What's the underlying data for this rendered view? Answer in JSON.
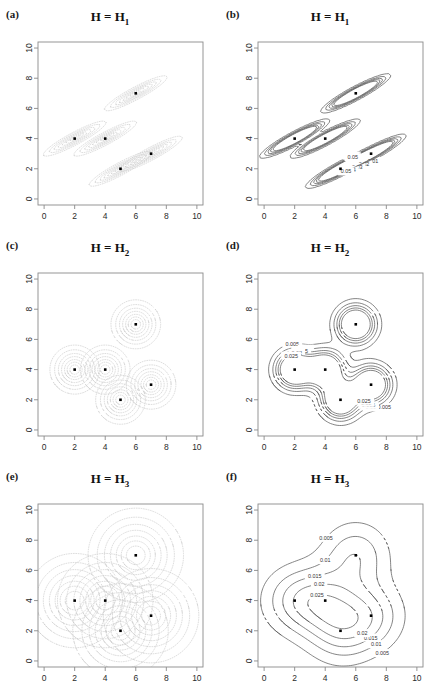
{
  "figure": {
    "width": 440,
    "height": 693,
    "background": "#ffffff",
    "panel_rows": 3,
    "panel_cols": 2
  },
  "style": {
    "box_color": "#8a8a8a",
    "axis_text_color": "#2b2b2b",
    "point_color": "#000000",
    "kernel_contour_color": "#c9c9c9",
    "density_contour_color": "#555555",
    "contour_label_color": "#333333"
  },
  "data_points": {
    "label": "sample points",
    "marker": "filled-square",
    "x": [
      2,
      4,
      5,
      6,
      7
    ],
    "y": [
      4,
      4,
      2,
      7,
      3
    ],
    "points": [
      {
        "x": 2,
        "y": 4
      },
      {
        "x": 4,
        "y": 4
      },
      {
        "x": 5,
        "y": 2
      },
      {
        "x": 6,
        "y": 7
      },
      {
        "x": 7,
        "y": 3
      }
    ]
  },
  "axes": {
    "xlim": [
      -0.4,
      10.4
    ],
    "ylim": [
      -0.4,
      10.4
    ],
    "xticks": [
      0,
      2,
      4,
      6,
      8,
      10
    ],
    "yticks": [
      0,
      2,
      4,
      6,
      8,
      10
    ],
    "xticklabels": [
      "0",
      "2",
      "4",
      "6",
      "8",
      "10"
    ],
    "yticklabels": [
      "0",
      "2",
      "4",
      "6",
      "8",
      "10"
    ],
    "ylabel_rotated": true,
    "grid": false
  },
  "bandwidths": {
    "H1": {
      "name": "H1",
      "sxx": 1.0,
      "syy": 0.32,
      "sxy": 0.52
    },
    "H2": {
      "name": "H2",
      "sxx": 0.62,
      "syy": 0.62,
      "sxy": 0.0
    },
    "H3": {
      "name": "H3",
      "sxx": 2.3,
      "syy": 2.3,
      "sxy": 0.0
    }
  },
  "panels": [
    {
      "tag": "(a)",
      "title_lhs": "H",
      "title_eq": " = ",
      "title_rhs": "H",
      "title_sub": "1",
      "kind": "kernels",
      "bandwidth": "H1",
      "kernel_levels": [
        0.12,
        0.25,
        0.4,
        0.55,
        0.7,
        0.82,
        0.92
      ],
      "contour_labels": []
    },
    {
      "tag": "(b)",
      "title_lhs": "H",
      "title_eq": " = ",
      "title_rhs": "H",
      "title_sub": "1",
      "kind": "density",
      "bandwidth": "H1",
      "contour_levels": [
        0.01,
        0.02,
        0.03,
        0.04,
        0.05
      ],
      "contour_labels": [
        "0.01",
        "0.02",
        "0.03",
        "0.04",
        "0.05"
      ]
    },
    {
      "tag": "(c)",
      "title_lhs": "H",
      "title_eq": " = ",
      "title_rhs": "H",
      "title_sub": "2",
      "kind": "kernels",
      "bandwidth": "H2",
      "kernel_levels": [
        0.12,
        0.25,
        0.4,
        0.55,
        0.7,
        0.82,
        0.92
      ],
      "contour_labels": []
    },
    {
      "tag": "(d)",
      "title_lhs": "H",
      "title_eq": " = ",
      "title_rhs": "H",
      "title_sub": "2",
      "kind": "density",
      "bandwidth": "H2",
      "contour_levels": [
        0.005,
        0.01,
        0.015,
        0.02,
        0.025
      ],
      "contour_labels": [
        "0.005",
        "0.01",
        "0.015",
        "0.02",
        "0.025"
      ]
    },
    {
      "tag": "(e)",
      "title_lhs": "H",
      "title_eq": " = ",
      "title_rhs": "H",
      "title_sub": "3",
      "kind": "kernels",
      "bandwidth": "H3",
      "kernel_levels": [
        0.12,
        0.25,
        0.4,
        0.55,
        0.7,
        0.82,
        0.92
      ],
      "contour_labels": []
    },
    {
      "tag": "(f)",
      "title_lhs": "H",
      "title_eq": " = ",
      "title_rhs": "H",
      "title_sub": "3",
      "kind": "density",
      "bandwidth": "H3",
      "contour_levels": [
        0.005,
        0.01,
        0.015,
        0.02,
        0.025
      ],
      "contour_labels": [
        "0.005",
        "0.01",
        "0.015",
        "0.02",
        "0.025"
      ]
    }
  ],
  "chart_data": {
    "type": "contour",
    "xlabel": "",
    "ylabel": "",
    "xlim": [
      -0.4,
      10.4
    ],
    "ylim": [
      -0.4,
      10.4
    ],
    "grid": false,
    "legend": "none",
    "sample": {
      "n": 5,
      "x": [
        2,
        4,
        5,
        6,
        7
      ],
      "y": [
        4,
        4,
        2,
        6,
        3
      ]
    },
    "panels": [
      {
        "tag": "(a)",
        "title": "H = H1",
        "content": "individual kernel contours, anisotropic positively-correlated ellipses",
        "levels": [
          0.12,
          0.25,
          0.4,
          0.55,
          0.7,
          0.82,
          0.92
        ],
        "labeled_levels": []
      },
      {
        "tag": "(b)",
        "title": "H = H1",
        "content": "pooled density estimate, three separated modes",
        "levels": [
          0.01,
          0.02,
          0.03,
          0.04,
          0.05
        ],
        "labeled_levels": [
          "0.01",
          "0.02",
          "0.03",
          "0.04",
          "0.05"
        ]
      },
      {
        "tag": "(c)",
        "title": "H = H2",
        "content": "individual kernel contours, isotropic circles",
        "levels": [
          0.12,
          0.25,
          0.4,
          0.55,
          0.7,
          0.82,
          0.92
        ],
        "labeled_levels": []
      },
      {
        "tag": "(d)",
        "title": "H = H2",
        "content": "pooled density estimate, one sharp mode at (6,7) plus merged lower cluster",
        "levels": [
          0.005,
          0.01,
          0.015,
          0.02,
          0.025
        ],
        "labeled_levels": [
          "0.005",
          "0.01",
          "0.015",
          "0.02",
          "0.025"
        ]
      },
      {
        "tag": "(e)",
        "title": "H = H3",
        "content": "individual kernel contours, large overlapping isotropic circles",
        "levels": [
          0.12,
          0.25,
          0.4,
          0.55,
          0.7,
          0.82,
          0.92
        ],
        "labeled_levels": []
      },
      {
        "tag": "(f)",
        "title": "H = H3",
        "content": "pooled density estimate, single oversmoothed unimodal blob",
        "levels": [
          0.005,
          0.01,
          0.015,
          0.02,
          0.025
        ],
        "labeled_levels": [
          "0.005",
          "0.01",
          "0.015",
          "0.02",
          "0.025"
        ]
      }
    ]
  }
}
